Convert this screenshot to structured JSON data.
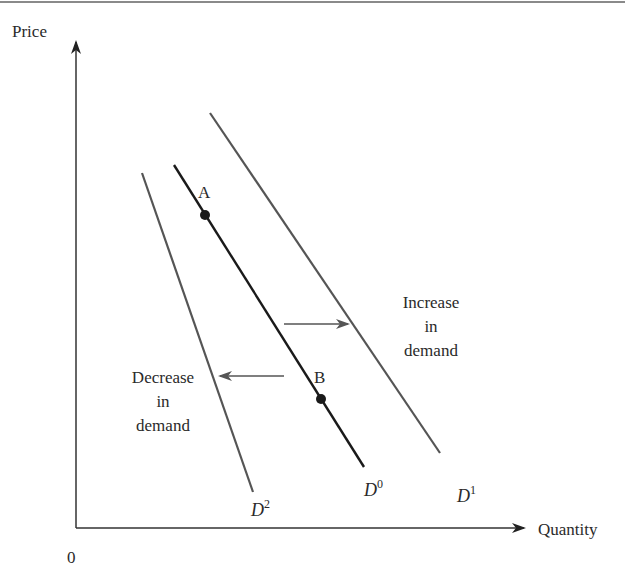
{
  "diagram": {
    "type": "supply-demand-shift",
    "axes": {
      "y_label": "Price",
      "x_label": "Quantity",
      "origin_label": "0"
    },
    "curves": [
      {
        "id": "D0",
        "base": "D",
        "sup": "0",
        "x1": 174,
        "y1": 165,
        "x2": 364,
        "y2": 467,
        "color": "#1a1a1a"
      },
      {
        "id": "D1",
        "base": "D",
        "sup": "1",
        "x1": 210,
        "y1": 113,
        "x2": 440,
        "y2": 453,
        "color": "#555555"
      },
      {
        "id": "D2",
        "base": "D",
        "sup": "2",
        "x1": 142,
        "y1": 173,
        "x2": 253,
        "y2": 492,
        "color": "#555555"
      }
    ],
    "points": [
      {
        "label": "A",
        "x": 205,
        "y": 215
      },
      {
        "label": "B",
        "x": 321,
        "y": 399
      }
    ],
    "annotations": {
      "increase": [
        "Increase",
        "in",
        "demand"
      ],
      "decrease": [
        "Decrease",
        "in",
        "demand"
      ]
    },
    "colors": {
      "axis": "#333333",
      "curve_main": "#1a1a1a",
      "curve_shift": "#555555",
      "arrow": "#555555",
      "frame_top": "#8a8a8a"
    }
  }
}
